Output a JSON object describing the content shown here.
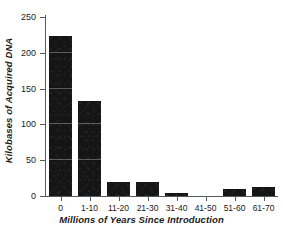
{
  "chart_data": {
    "type": "bar",
    "title": "",
    "xlabel": "Millions of Years Since Introduction",
    "ylabel": "Kilobases of Acquired DNA",
    "categories": [
      "0",
      "1-10",
      "11-20",
      "21-30",
      "31-40",
      "41-50",
      "51-60",
      "61-70"
    ],
    "values": [
      223,
      133,
      19,
      20,
      4,
      0,
      10,
      12
    ],
    "ylim": [
      0,
      250
    ],
    "yticks": [
      0,
      50,
      100,
      150,
      200,
      250
    ],
    "ytick_labels": [
      "0",
      "50",
      "100",
      "150",
      "200",
      "250"
    ],
    "grid": false,
    "legend": false,
    "bar_color": "#151515",
    "axis_color": "#555a5e",
    "text_color": "#1a1a1a",
    "background": "#ffffff"
  }
}
